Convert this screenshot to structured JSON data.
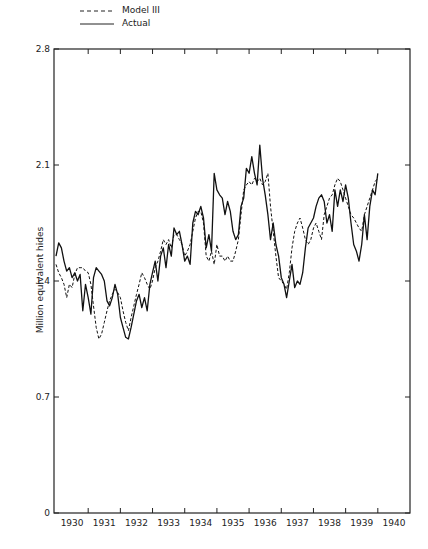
{
  "chart_data": {
    "type": "line",
    "title": "",
    "xlabel": "",
    "ylabel": "Million equivalent hides",
    "ylim": [
      0,
      2.8
    ],
    "yticks": [
      0,
      0.7,
      1.4,
      2.1,
      2.8
    ],
    "ytick_labels": [
      "0",
      "0.7",
      "1.4",
      "2.1",
      "2.8"
    ],
    "xtick_labels": [
      "1930",
      "1931",
      "1932",
      "1933",
      "1934",
      "1935",
      "1936",
      "1937",
      "1938",
      "1939",
      "1940"
    ],
    "x_start": 1930.0,
    "x_step_months": 1,
    "legend": [
      {
        "name": "Model III",
        "style": "dashed"
      },
      {
        "name": "Actual",
        "style": "solid"
      }
    ],
    "legend_position": "top-left, above plot",
    "grid": false,
    "series": [
      {
        "name": "Actual",
        "style": "solid",
        "values": [
          1.55,
          1.63,
          1.6,
          1.52,
          1.46,
          1.48,
          1.42,
          1.45,
          1.4,
          1.44,
          1.22,
          1.38,
          1.3,
          1.2,
          1.42,
          1.48,
          1.46,
          1.44,
          1.4,
          1.28,
          1.25,
          1.3,
          1.38,
          1.32,
          1.18,
          1.12,
          1.06,
          1.05,
          1.12,
          1.2,
          1.28,
          1.32,
          1.24,
          1.3,
          1.22,
          1.38,
          1.45,
          1.52,
          1.4,
          1.55,
          1.6,
          1.48,
          1.62,
          1.55,
          1.72,
          1.68,
          1.7,
          1.62,
          1.52,
          1.55,
          1.5,
          1.75,
          1.82,
          1.8,
          1.85,
          1.78,
          1.6,
          1.68,
          1.58,
          2.05,
          1.95,
          1.92,
          1.9,
          1.8,
          1.88,
          1.82,
          1.7,
          1.65,
          1.68,
          1.85,
          1.9,
          2.08,
          2.05,
          2.15,
          2.05,
          1.98,
          2.22,
          2.02,
          1.92,
          1.8,
          1.65,
          1.75,
          1.62,
          1.55,
          1.42,
          1.38,
          1.3,
          1.4,
          1.5,
          1.36,
          1.4,
          1.38,
          1.45,
          1.6,
          1.72,
          1.75,
          1.78,
          1.85,
          1.9,
          1.92,
          1.88,
          1.75,
          1.8,
          1.7,
          1.95,
          1.85,
          1.95,
          1.88,
          1.98,
          1.9,
          1.75,
          1.62,
          1.58,
          1.52,
          1.62,
          1.8,
          1.65,
          1.85,
          1.95,
          1.92,
          2.05
        ]
      },
      {
        "name": "Model III",
        "style": "dashed",
        "values": [
          1.5,
          1.45,
          1.42,
          1.38,
          1.3,
          1.38,
          1.36,
          1.44,
          1.48,
          1.48,
          1.48,
          1.46,
          1.45,
          1.38,
          1.25,
          1.12,
          1.05,
          1.08,
          1.15,
          1.22,
          1.28,
          1.32,
          1.35,
          1.33,
          1.3,
          1.22,
          1.15,
          1.1,
          1.18,
          1.25,
          1.32,
          1.38,
          1.45,
          1.42,
          1.38,
          1.35,
          1.4,
          1.48,
          1.52,
          1.58,
          1.65,
          1.62,
          1.65,
          1.6,
          1.68,
          1.68,
          1.65,
          1.62,
          1.55,
          1.58,
          1.62,
          1.7,
          1.78,
          1.82,
          1.82,
          1.75,
          1.55,
          1.52,
          1.58,
          1.5,
          1.62,
          1.55,
          1.55,
          1.52,
          1.55,
          1.52,
          1.52,
          1.58,
          1.65,
          1.8,
          1.95,
          1.98,
          2.0,
          1.98,
          2.02,
          2.0,
          2.02,
          1.98,
          2.0,
          2.05,
          1.85,
          1.7,
          1.55,
          1.42,
          1.4,
          1.38,
          1.35,
          1.45,
          1.6,
          1.7,
          1.75,
          1.78,
          1.72,
          1.65,
          1.62,
          1.65,
          1.72,
          1.75,
          1.7,
          1.65,
          1.8,
          1.85,
          1.9,
          1.92,
          1.98,
          2.02,
          2.0,
          1.95,
          1.9,
          1.85,
          1.8,
          1.78,
          1.75,
          1.72,
          1.7,
          1.8,
          1.85,
          1.9,
          1.95,
          2.0,
          2.02
        ]
      }
    ]
  },
  "legend": {
    "model_label": "Model III",
    "actual_label": "Actual"
  },
  "axis": {
    "ylabel": "Million equivalent hides"
  }
}
